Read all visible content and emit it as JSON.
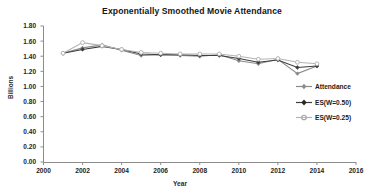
{
  "chart_data": {
    "type": "line",
    "title": "Exponentially Smoothed Movie Attendance",
    "xlabel": "Year",
    "ylabel": "Billions",
    "xlim": [
      2000,
      2016
    ],
    "ylim": [
      0.0,
      1.8
    ],
    "xticks": [
      "2000",
      "2002",
      "2004",
      "2006",
      "2008",
      "2010",
      "2012",
      "2014",
      "2016"
    ],
    "yticks": [
      "0.00",
      "0.20",
      "0.40",
      "0.60",
      "0.80",
      "1.00",
      "1.20",
      "1.40",
      "1.60",
      "1.80"
    ],
    "grid": false,
    "legend_position": "right",
    "x": [
      2001,
      2002,
      2003,
      2004,
      2005,
      2006,
      2007,
      2008,
      2009,
      2010,
      2011,
      2012,
      2013,
      2014
    ],
    "series": [
      {
        "name": "Attendance",
        "color": "#8a8a8a",
        "marker": "diamond",
        "values": [
          1.44,
          1.51,
          1.55,
          1.48,
          1.41,
          1.42,
          1.41,
          1.4,
          1.42,
          1.34,
          1.3,
          1.36,
          1.17,
          1.27
        ]
      },
      {
        "name": "ES(W=0.50)",
        "color": "#3d3d3d",
        "marker": "diamond",
        "values": [
          1.44,
          1.49,
          1.53,
          1.49,
          1.43,
          1.42,
          1.42,
          1.41,
          1.41,
          1.37,
          1.32,
          1.35,
          1.25,
          1.27
        ]
      },
      {
        "name": "ES(W=0.25)",
        "color": "#b4b4b4",
        "marker": "circle",
        "values": [
          1.44,
          1.58,
          1.54,
          1.49,
          1.45,
          1.44,
          1.43,
          1.43,
          1.43,
          1.4,
          1.36,
          1.37,
          1.32,
          1.3
        ]
      }
    ]
  },
  "legend": {
    "entries": [
      {
        "label": "Attendance"
      },
      {
        "label": "ES(W=0.50)"
      },
      {
        "label": "ES(W=0.25)"
      }
    ]
  },
  "axes": {
    "y_title": "Billions",
    "x_title": "Year"
  }
}
